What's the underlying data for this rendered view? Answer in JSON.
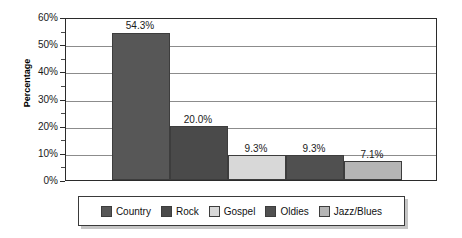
{
  "chart_data": {
    "type": "bar",
    "title": "",
    "xlabel": "",
    "ylabel": "Percentage",
    "categories": [
      "Country",
      "Rock",
      "Gospel",
      "Oldies",
      "Jazz/Blues"
    ],
    "values": [
      54.3,
      20.0,
      9.3,
      9.3,
      7.1
    ],
    "value_labels": [
      "54.3%",
      "20.0%",
      "9.3%",
      "9.3%",
      "7.1%"
    ],
    "ylim": [
      0,
      60
    ],
    "y_ticks": [
      0,
      10,
      20,
      30,
      40,
      50,
      60
    ],
    "y_tick_labels": [
      "0%",
      "10%",
      "20%",
      "30%",
      "40%",
      "50%",
      "60%"
    ],
    "y_minor_ticks": [
      5,
      15,
      25,
      35,
      45,
      55
    ],
    "grid": "horizontal",
    "legend_position": "bottom",
    "series_colors": [
      "#575757",
      "#4a4a4a",
      "#d8d8d8",
      "#505050",
      "#b5b5b5"
    ],
    "legend": [
      {
        "label": "Country",
        "color": "#575757"
      },
      {
        "label": "Rock",
        "color": "#4a4a4a"
      },
      {
        "label": "Gospel",
        "color": "#d8d8d8"
      },
      {
        "label": "Oldies",
        "color": "#505050"
      },
      {
        "label": "Jazz/Blues",
        "color": "#b5b5b5"
      }
    ]
  }
}
